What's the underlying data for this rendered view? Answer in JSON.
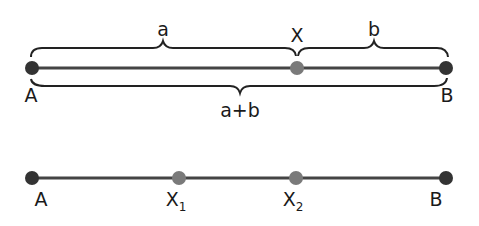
{
  "diagram": {
    "top": {
      "points": [
        {
          "label": "A",
          "x": 32,
          "color": "#333333"
        },
        {
          "label": "X",
          "x": 297,
          "color": "#7a7a7a"
        },
        {
          "label": "B",
          "x": 446,
          "color": "#333333"
        }
      ],
      "braces": {
        "a": "a",
        "b": "b",
        "sum": "a+b"
      }
    },
    "bottom": {
      "points": [
        {
          "label": "A",
          "sub": "",
          "x": 32,
          "color": "#333333"
        },
        {
          "label": "X",
          "sub": "1",
          "x": 179,
          "color": "#7a7a7a"
        },
        {
          "label": "X",
          "sub": "2",
          "x": 296,
          "color": "#7a7a7a"
        },
        {
          "label": "B",
          "sub": "",
          "x": 446,
          "color": "#333333"
        }
      ]
    },
    "colors": {
      "line": "#444444",
      "endpoint": "#333333",
      "midpoint": "#7a7a7a",
      "brace": "#222222"
    }
  }
}
